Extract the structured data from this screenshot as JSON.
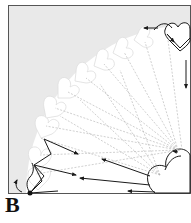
{
  "panel": {
    "label": "B",
    "background_color": "#e9e9e9",
    "frame_color": "#555555",
    "heart_fill": "#ffffff",
    "ray_color": "#aaaaaa",
    "arrow_color": "#1a1a1a"
  },
  "diagram": {
    "origin_corner": "bottom-right",
    "start_point": "bottom-left dot",
    "heart_count": 11
  }
}
